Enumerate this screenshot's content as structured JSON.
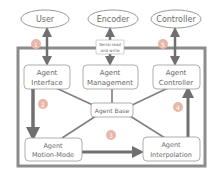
{
  "external": {
    "user": "User",
    "encoder": "Encoder",
    "controller": "Controller"
  },
  "serial_label": {
    "line1": "Serial read",
    "line2": "and write"
  },
  "modules": {
    "interface": {
      "line1": "Agent",
      "line2": "Interface"
    },
    "management": {
      "line1": "Agent",
      "line2": "Management"
    },
    "controller": {
      "line1": "Agent",
      "line2": "Controller"
    },
    "base": {
      "line1": "Agent Base"
    },
    "motion_mode": {
      "line1": "Agent",
      "line2": "Motion-Mode"
    },
    "interpolation": {
      "line1": "Agent",
      "line2": "Interpolation"
    }
  },
  "steps": [
    "1",
    "2",
    "3",
    "4",
    "5"
  ],
  "colors": {
    "arrow": "#707070",
    "frame": "#8c8c8c",
    "box_border": "#9a9a9a",
    "text": "#6a6a6a",
    "step_circle": "#e8b7a8",
    "step_text": "#ffffff"
  }
}
